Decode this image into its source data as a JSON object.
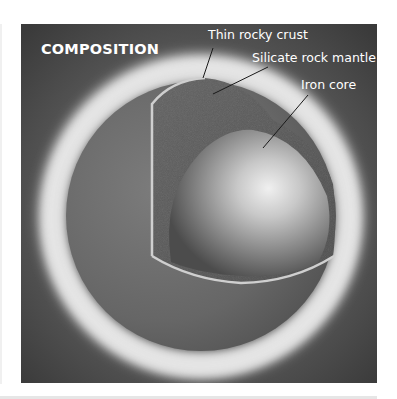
{
  "figure": {
    "title": "COMPOSITION",
    "labels": [
      {
        "id": "crust",
        "text": "Thin rocky crust"
      },
      {
        "id": "mantle",
        "text": "Silicate rock mantle"
      },
      {
        "id": "core",
        "text": "Iron core"
      }
    ]
  },
  "colors": {
    "background": "#4a4a4a",
    "glow_ring": "#e4e4e4",
    "sphere_surface": "#6e6e6e",
    "mantle": "#5a5a5a",
    "core_highlight": "#e8e8e8",
    "crust_edge": "#c8c8c8",
    "text": "#ffffff"
  }
}
